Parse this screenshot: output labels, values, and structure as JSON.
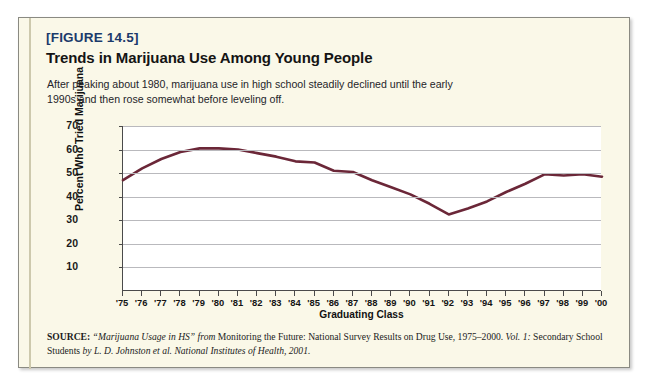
{
  "figure": {
    "number_label": "[FIGURE 14.5]",
    "title": "Trends in Marijuana Use Among Young People",
    "caption": "After peaking about 1980, marijuana use in high school steadily declined until the early 1990s and then rose somewhat before leveling off.",
    "accent_color": "#1b3a6b",
    "panel_color": "#faf8e8",
    "border_color": "#8a8a82"
  },
  "source": {
    "label": "SOURCE:",
    "quoted_title": "“Marijuana Usage in HS”",
    "from_word": "from",
    "publication": "Monitoring the Future: National Survey Results on Drug Use, 1975–2000.",
    "volume": "Vol. 1:",
    "volume_continued": "Secondary School Students",
    "by_word": "by",
    "authors": "L. D. Johnston et al. National Institutes of Health, 2001."
  },
  "chart_data": {
    "type": "line",
    "title": "Trends in Marijuana Use Among Young People",
    "xlabel": "Graduating Class",
    "ylabel": "Percent Who Tried Marijuana",
    "ylim": [
      0,
      70
    ],
    "yticks": [
      10,
      20,
      30,
      40,
      50,
      60,
      70
    ],
    "grid": true,
    "legend": "none",
    "line_color": "#6b2738",
    "categories": [
      "'75",
      "'76",
      "'77",
      "'78",
      "'79",
      "'80",
      "'81",
      "'82",
      "'83",
      "'84",
      "'85",
      "'86",
      "'87",
      "'88",
      "'89",
      "'90",
      "'91",
      "'92",
      "'93",
      "'94",
      "'95",
      "'96",
      "'97",
      "'98",
      "'99",
      "'00"
    ],
    "values": [
      47,
      52,
      56,
      59,
      60.5,
      60.5,
      60,
      58.5,
      57,
      55,
      54.5,
      51,
      50.5,
      47,
      44,
      41,
      37,
      32.5,
      35,
      38,
      42,
      45.5,
      49.5,
      49,
      49.5,
      48.5
    ]
  }
}
